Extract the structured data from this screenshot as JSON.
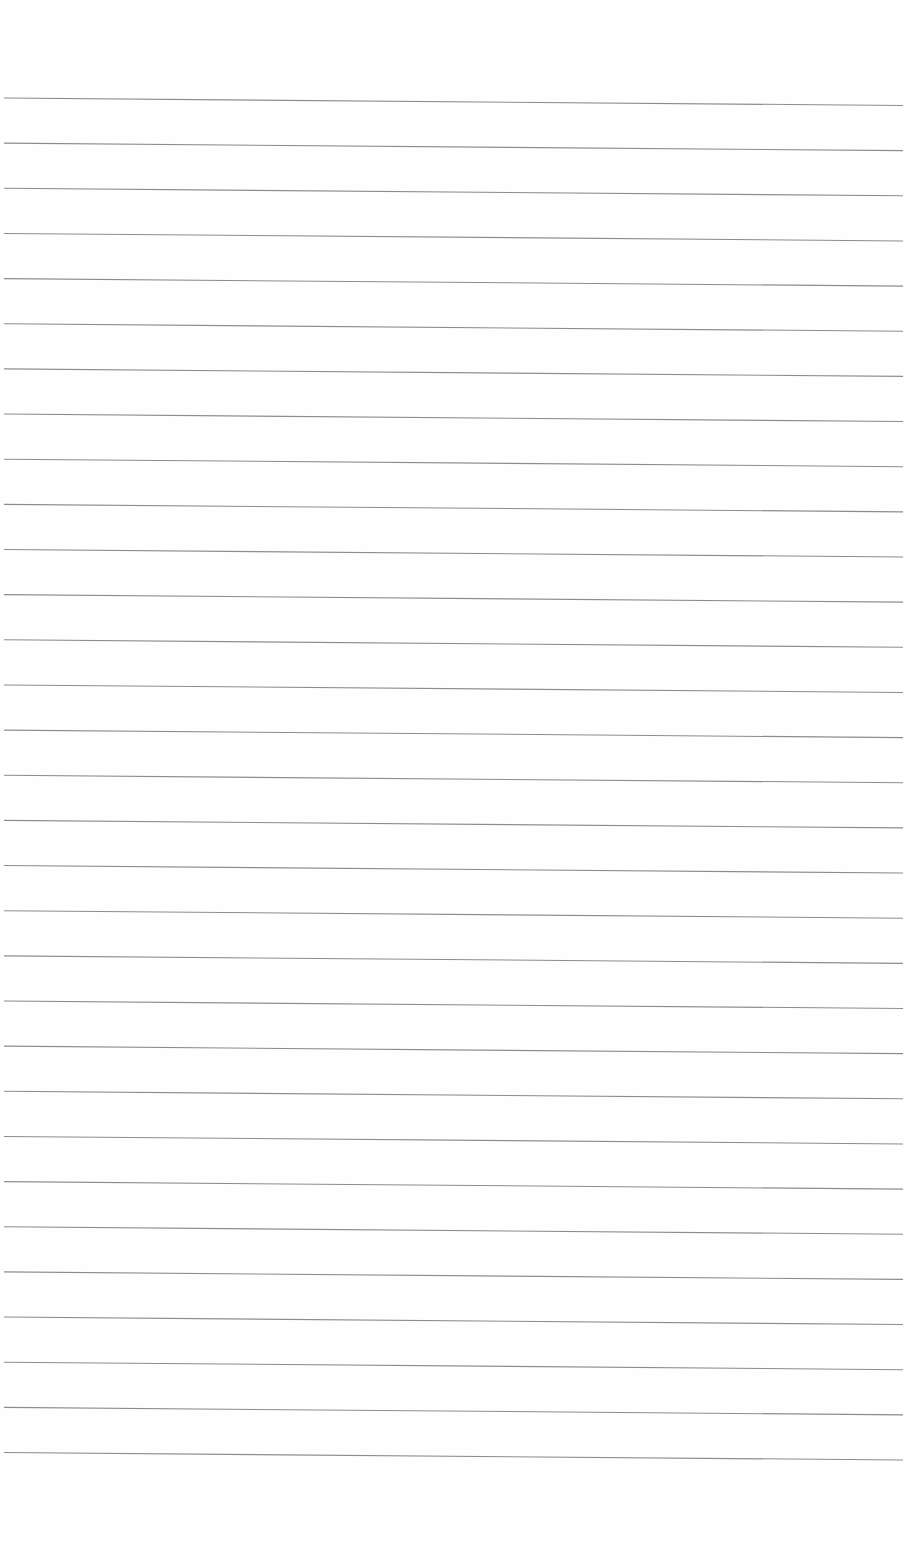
{
  "page": {
    "type": "lined-paper",
    "background_color": "#fefefe",
    "rule_color": "#8c8c8c",
    "rule_count": 31,
    "first_rule_y_left": 98,
    "rule_spacing": 45.15,
    "rule_x_start": 4,
    "rule_x_end": 903,
    "rule_slope_offset": 7.5,
    "text": ""
  }
}
